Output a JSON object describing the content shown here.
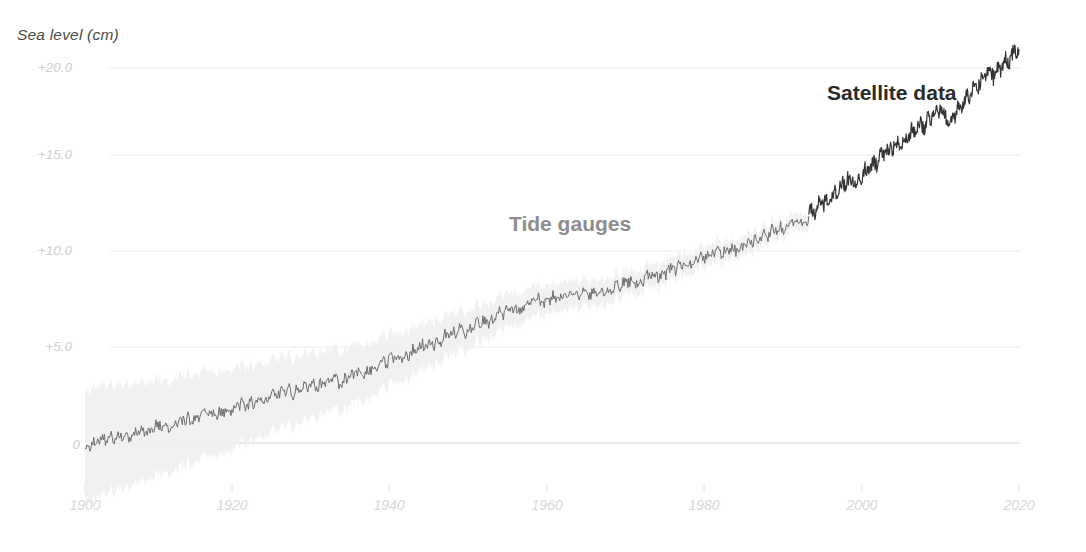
{
  "chart_data": {
    "type": "line",
    "title": "",
    "subtitle": "",
    "ylabel": "Sea level (cm)",
    "xlabel": "",
    "xlim": [
      1900,
      2020
    ],
    "ylim": [
      -2.0,
      22.0
    ],
    "grid": true,
    "legend_position": "inline-annotation",
    "y_ticks": [
      "0",
      "+5.0",
      "+10.0",
      "+15.0",
      "+20.0"
    ],
    "y_tick_values": [
      0,
      5,
      10,
      15,
      20
    ],
    "x_ticks": [
      "1900",
      "1920",
      "1940",
      "1960",
      "1980",
      "2000",
      "2020"
    ],
    "x_tick_values": [
      1900,
      1920,
      1940,
      1960,
      1980,
      2000,
      2020
    ],
    "annotations": [
      {
        "text": "Tide gauges",
        "x": 1957,
        "y": 11.8,
        "color": "#8d8d8d"
      },
      {
        "text": "Satellite data",
        "x": 2000,
        "y": 18.6,
        "color": "#2b2b2b"
      }
    ],
    "colors": {
      "tide_line": "#6e6e6e",
      "satellite_line": "#333333",
      "uncertainty_band": "#efefef",
      "gridline": "#ededed",
      "zero_line": "#d6d6d6",
      "axis_title": "#4a4a4a",
      "tick_label": "#d5d5d5",
      "background": "#ffffff"
    },
    "series": [
      {
        "name": "Tide gauges",
        "x": [
          1900,
          1901,
          1902,
          1903,
          1904,
          1905,
          1906,
          1907,
          1908,
          1909,
          1910,
          1911,
          1912,
          1913,
          1914,
          1915,
          1916,
          1917,
          1918,
          1919,
          1920,
          1921,
          1922,
          1923,
          1924,
          1925,
          1926,
          1927,
          1928,
          1929,
          1930,
          1931,
          1932,
          1933,
          1934,
          1935,
          1936,
          1937,
          1938,
          1939,
          1940,
          1941,
          1942,
          1943,
          1944,
          1945,
          1946,
          1947,
          1948,
          1949,
          1950,
          1951,
          1952,
          1953,
          1954,
          1955,
          1956,
          1957,
          1958,
          1959,
          1960,
          1961,
          1962,
          1963,
          1964,
          1965,
          1966,
          1967,
          1968,
          1969,
          1970,
          1971,
          1972,
          1973,
          1974,
          1975,
          1976,
          1977,
          1978,
          1979,
          1980,
          1981,
          1982,
          1983,
          1984,
          1985,
          1986,
          1987,
          1988,
          1989,
          1990,
          1991,
          1992,
          1993
        ],
        "values": [
          -0.2,
          0.0,
          0.1,
          0.3,
          0.2,
          0.5,
          0.4,
          0.7,
          0.6,
          0.9,
          1.0,
          0.9,
          1.2,
          1.3,
          1.2,
          1.5,
          1.6,
          1.5,
          1.8,
          1.9,
          2.1,
          2.0,
          2.3,
          2.2,
          2.5,
          2.6,
          2.8,
          2.7,
          3.0,
          3.1,
          3.0,
          3.3,
          3.4,
          3.2,
          3.6,
          3.8,
          3.7,
          4.0,
          4.2,
          4.4,
          4.6,
          4.5,
          4.9,
          5.1,
          5.3,
          5.2,
          5.6,
          5.8,
          6.0,
          5.9,
          6.3,
          6.5,
          6.4,
          6.8,
          7.0,
          7.2,
          7.1,
          7.5,
          7.6,
          7.5,
          7.8,
          7.7,
          7.9,
          7.8,
          8.0,
          7.9,
          8.2,
          8.1,
          8.3,
          8.5,
          8.6,
          8.5,
          8.8,
          9.0,
          8.9,
          9.2,
          9.3,
          9.5,
          9.6,
          9.8,
          10.0,
          10.2,
          10.1,
          10.4,
          10.3,
          10.6,
          10.8,
          11.0,
          11.2,
          11.4,
          11.6,
          11.8,
          11.7,
          12.1
        ],
        "color": "#6e6e6e",
        "uncertainty_cm": [
          3.0,
          2.95,
          2.9,
          2.85,
          2.8,
          2.75,
          2.7,
          2.65,
          2.6,
          2.55,
          2.5,
          2.45,
          2.42,
          2.38,
          2.35,
          2.3,
          2.27,
          2.23,
          2.2,
          2.15,
          2.1,
          2.05,
          2.0,
          1.97,
          1.93,
          1.9,
          1.85,
          1.82,
          1.78,
          1.75,
          1.7,
          1.67,
          1.63,
          1.6,
          1.55,
          1.52,
          1.48,
          1.45,
          1.4,
          1.37,
          1.33,
          1.3,
          1.27,
          1.23,
          1.2,
          1.17,
          1.13,
          1.1,
          1.07,
          1.03,
          1.0,
          0.97,
          0.95,
          0.92,
          0.9,
          0.88,
          0.85,
          0.83,
          0.8,
          0.79,
          0.77,
          0.75,
          0.74,
          0.72,
          0.71,
          0.7,
          0.69,
          0.68,
          0.67,
          0.66,
          0.65,
          0.64,
          0.63,
          0.62,
          0.61,
          0.6,
          0.59,
          0.58,
          0.57,
          0.56,
          0.55,
          0.54,
          0.53,
          0.52,
          0.51,
          0.5,
          0.5,
          0.49,
          0.48,
          0.47,
          0.46,
          0.45,
          0.44,
          0.43
        ]
      },
      {
        "name": "Satellite data",
        "x": [
          1993,
          1994,
          1995,
          1996,
          1997,
          1998,
          1999,
          2000,
          2001,
          2002,
          2003,
          2004,
          2005,
          2006,
          2007,
          2008,
          2009,
          2010,
          2011,
          2012,
          2013,
          2014,
          2015,
          2016,
          2017,
          2018,
          2019,
          2020
        ],
        "values": [
          12.1,
          12.5,
          12.8,
          13.2,
          13.6,
          14.1,
          13.9,
          14.3,
          14.7,
          15.1,
          15.5,
          15.8,
          16.1,
          16.5,
          16.8,
          17.0,
          17.5,
          17.9,
          17.1,
          17.7,
          18.3,
          18.7,
          19.2,
          19.8,
          19.6,
          20.2,
          20.6,
          21.0
        ],
        "color": "#333333"
      }
    ]
  }
}
